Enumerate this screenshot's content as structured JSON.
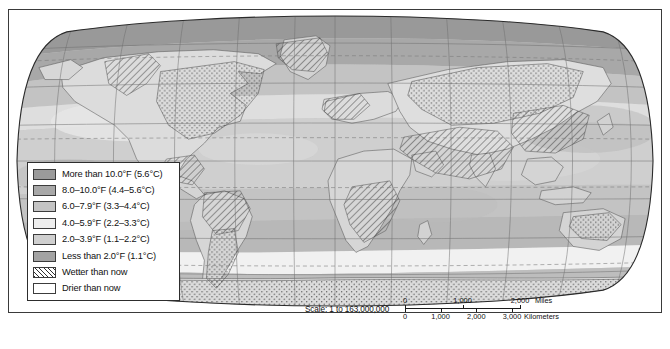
{
  "map": {
    "title": "World climate change map",
    "projection": "robinson",
    "graticule": {
      "meridian_interval_deg": 30,
      "parallel_interval_deg": 30,
      "special_parallels": [
        "Tropic of Cancer",
        "Tropic of Capricorn",
        "Arctic Circle",
        "Antarctic Circle"
      ]
    },
    "ocean_fill": "#c9c9c9",
    "frame_color": "#3a3a3a"
  },
  "legend": {
    "items": [
      {
        "label": "More than 10.0°F (5.6°C)",
        "swatch": "solid",
        "color": "#9a9a9a",
        "name": "legend-swatch-more-than-10f"
      },
      {
        "label": "8.0–10.0°F (4.4–5.6°C)",
        "swatch": "solid",
        "color": "#a8a8a8",
        "name": "legend-swatch-8-to-10f"
      },
      {
        "label": "6.0–7.9°F (3.3–4.4°C)",
        "swatch": "solid",
        "color": "#c4c4c4",
        "name": "legend-swatch-6-to-79f"
      },
      {
        "label": "4.0–5.9°F (2.2–3.3°C)",
        "swatch": "solid",
        "color": "#eeeeee",
        "name": "legend-swatch-4-to-59f"
      },
      {
        "label": "2.0–3.9°F (1.1–2.2°C)",
        "swatch": "solid",
        "color": "#cfcfcf",
        "name": "legend-swatch-2-to-39f"
      },
      {
        "label": "Less than 2.0°F (1.1°C)",
        "swatch": "solid",
        "color": "#a3a3a3",
        "name": "legend-swatch-less-than-2f"
      },
      {
        "label": "Wetter than now",
        "swatch": "hatch",
        "color": "#2f2f2f",
        "name": "legend-swatch-wetter"
      },
      {
        "label": "Drier than now",
        "swatch": "stipple",
        "color": "#3a3a3a",
        "name": "legend-swatch-drier"
      }
    ]
  },
  "scale": {
    "text": "Scale:  1 to 163,000,000",
    "miles": {
      "unit": "Miles",
      "ticks": [
        "0",
        "1,000",
        "2,000"
      ],
      "tick_positions_pct": [
        0,
        50,
        100
      ]
    },
    "kilometers": {
      "unit": "Kilometers",
      "ticks": [
        "0",
        "1,000",
        "2,000",
        "3,000"
      ],
      "tick_positions_pct": [
        0,
        31,
        62,
        93
      ]
    }
  }
}
